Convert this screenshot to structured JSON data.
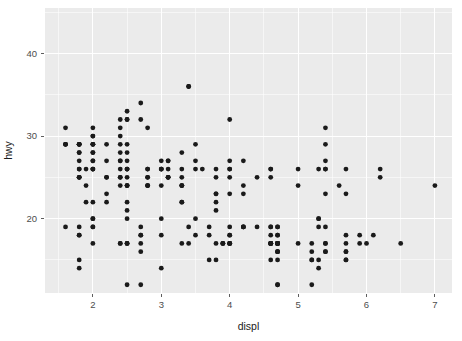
{
  "chart_data": {
    "type": "scatter",
    "title": "",
    "subtitle": "",
    "xlabel": "displ",
    "ylabel": "hwy",
    "xlim": [
      1.3,
      7.25
    ],
    "ylim": [
      11.0,
      45.5
    ],
    "xticks": [
      2,
      3,
      4,
      5,
      6,
      7
    ],
    "xtick_labels": [
      "2",
      "3",
      "4",
      "5",
      "6",
      "7"
    ],
    "yticks": [
      20,
      30,
      40
    ],
    "ytick_labels": [
      "20",
      "30",
      "40"
    ],
    "x_minor_ticks": [
      1.5,
      2.5,
      3.5,
      4.5,
      5.5,
      6.5
    ],
    "y_minor_ticks": [
      15,
      25,
      35,
      45
    ],
    "grid": true,
    "legend": null,
    "point_color": "#1a1a1a",
    "point_radius": 2.4,
    "panel_background": "#ebebeb",
    "grid_color": "#ffffff",
    "axis_text_color": "#4d4d4d",
    "n_points": 234,
    "x": [
      1.8,
      1.8,
      2.0,
      2.0,
      2.8,
      2.8,
      3.1,
      1.8,
      1.8,
      2.0,
      2.0,
      2.8,
      2.8,
      3.1,
      3.1,
      2.8,
      3.1,
      4.2,
      5.3,
      5.3,
      5.3,
      5.7,
      6.0,
      5.7,
      5.7,
      6.2,
      6.2,
      7.0,
      5.3,
      5.3,
      5.7,
      6.5,
      2.4,
      2.4,
      3.1,
      3.5,
      3.6,
      2.4,
      3.0,
      3.3,
      3.3,
      3.3,
      3.3,
      3.3,
      3.8,
      3.8,
      3.8,
      4.0,
      3.7,
      3.7,
      3.9,
      3.9,
      4.7,
      4.7,
      4.7,
      5.2,
      5.2,
      3.9,
      4.7,
      4.7,
      4.7,
      5.2,
      5.7,
      5.9,
      4.7,
      4.7,
      4.7,
      4.7,
      4.7,
      4.7,
      5.2,
      5.2,
      5.7,
      5.9,
      4.6,
      5.4,
      5.4,
      4.0,
      4.0,
      4.6,
      5.0,
      4.2,
      4.2,
      4.6,
      4.6,
      4.6,
      5.4,
      5.4,
      3.8,
      3.8,
      4.0,
      4.0,
      4.6,
      4.6,
      4.6,
      4.6,
      5.4,
      1.6,
      1.6,
      1.6,
      1.6,
      1.6,
      1.8,
      1.8,
      1.8,
      2.0,
      2.4,
      2.4,
      2.4,
      2.4,
      2.5,
      2.5,
      3.3,
      2.0,
      2.0,
      2.0,
      2.0,
      2.7,
      2.7,
      2.7,
      3.0,
      3.7,
      4.0,
      4.7,
      4.7,
      4.7,
      5.7,
      6.1,
      4.0,
      4.2,
      4.4,
      4.6,
      5.4,
      5.4,
      5.4,
      4.0,
      4.0,
      4.6,
      5.0,
      2.4,
      2.4,
      2.5,
      2.5,
      3.5,
      3.5,
      3.0,
      3.0,
      3.5,
      3.3,
      3.3,
      4.0,
      5.6,
      3.1,
      3.8,
      3.8,
      3.8,
      5.3,
      2.5,
      2.5,
      2.5,
      2.5,
      2.5,
      2.5,
      2.2,
      2.2,
      2.5,
      2.5,
      2.5,
      2.5,
      2.5,
      2.5,
      2.7,
      2.7,
      3.4,
      3.4,
      2.0,
      2.0,
      2.0,
      2.0,
      2.8,
      1.9,
      2.0,
      2.0,
      2.0,
      2.0,
      2.5,
      2.5,
      2.8,
      2.8,
      1.9,
      1.9,
      2.0,
      2.0,
      2.5,
      2.5,
      1.8,
      1.8,
      1.8,
      1.8,
      1.8,
      4.7,
      5.7,
      2.7,
      2.7,
      2.7,
      3.4,
      3.4,
      4.0,
      4.7,
      2.2,
      2.2,
      2.4,
      2.4,
      3.0,
      3.0,
      3.5,
      2.2,
      2.2,
      2.4,
      2.4,
      3.0,
      3.0,
      3.3,
      1.8,
      1.8,
      1.8,
      1.8,
      1.8,
      4.2,
      4.2,
      4.4,
      4.6,
      5.4,
      5.4,
      5.4,
      4.0,
      4.0,
      4.6,
      5.0
    ],
    "y": [
      29,
      29,
      31,
      30,
      26,
      26,
      27,
      26,
      25,
      28,
      27,
      25,
      25,
      25,
      25,
      24,
      25,
      23,
      20,
      15,
      20,
      17,
      17,
      26,
      23,
      26,
      25,
      24,
      19,
      14,
      15,
      17,
      27,
      30,
      26,
      29,
      26,
      24,
      24,
      22,
      22,
      24,
      24,
      17,
      22,
      21,
      23,
      23,
      19,
      18,
      17,
      17,
      19,
      19,
      12,
      17,
      15,
      17,
      17,
      12,
      17,
      16,
      18,
      18,
      16,
      16,
      17,
      17,
      17,
      16,
      12,
      15,
      16,
      17,
      15,
      17,
      17,
      18,
      17,
      19,
      17,
      19,
      19,
      17,
      17,
      17,
      16,
      16,
      17,
      15,
      17,
      17,
      18,
      17,
      19,
      17,
      19,
      19,
      29,
      31,
      29,
      29,
      29,
      29,
      28,
      29,
      26,
      29,
      28,
      27,
      24,
      24,
      24,
      22,
      19,
      20,
      17,
      12,
      19,
      18,
      14,
      15,
      18,
      18,
      15,
      17,
      16,
      18,
      17,
      19,
      19,
      17,
      29,
      27,
      31,
      32,
      27,
      26,
      26,
      25,
      25,
      17,
      17,
      20,
      18,
      26,
      26,
      27,
      28,
      25,
      25,
      24,
      27,
      25,
      26,
      23,
      26,
      26,
      26,
      26,
      25,
      24,
      21,
      22,
      23,
      22,
      20,
      33,
      32,
      32,
      29,
      32,
      34,
      36,
      36,
      29,
      26,
      27,
      30,
      31,
      26,
      26,
      28,
      26,
      29,
      28,
      27,
      24,
      24,
      24,
      22,
      19,
      20,
      17,
      12,
      19,
      18,
      14,
      15,
      18,
      18,
      15,
      17,
      16,
      18,
      17,
      19,
      19,
      17,
      29,
      27,
      31,
      32,
      27,
      26,
      26,
      25,
      25,
      17,
      17,
      20,
      18,
      26,
      26,
      27,
      28,
      25,
      25,
      24,
      27,
      25,
      26,
      23,
      26,
      26,
      26,
      26,
      25,
      24,
      21,
      22,
      23,
      22,
      20,
      33,
      32,
      32,
      29,
      32,
      34,
      36,
      36,
      29,
      26,
      27,
      30,
      31,
      26,
      26,
      28,
      26,
      29,
      28,
      27,
      24,
      24,
      24,
      22,
      19,
      20,
      17,
      12,
      19,
      18,
      14,
      15,
      18,
      18,
      15,
      17,
      16,
      18,
      17,
      19,
      19,
      17,
      29,
      27,
      31,
      32,
      27,
      26,
      26,
      25,
      25,
      17,
      17,
      20,
      18,
      26,
      26,
      27,
      28,
      25,
      25,
      24,
      27,
      25,
      26,
      23,
      26,
      26,
      26,
      26,
      25,
      24,
      21,
      22,
      23,
      22,
      20,
      33,
      32,
      32,
      29,
      32,
      34,
      36,
      36,
      29,
      26,
      27,
      30,
      31,
      26,
      26,
      28,
      26,
      29,
      28,
      27,
      24,
      24,
      24,
      22,
      19,
      20,
      17,
      12,
      19,
      18,
      14,
      15,
      18,
      18,
      15,
      17,
      16,
      18,
      17,
      19,
      19,
      17,
      29,
      27,
      31,
      32,
      27,
      26,
      26,
      25,
      25,
      17,
      17,
      20,
      18,
      26,
      26,
      27,
      28,
      25,
      25,
      24,
      27,
      25,
      26,
      23,
      26,
      26,
      26,
      26,
      25,
      24,
      21,
      22,
      23,
      22,
      20,
      33,
      32,
      32,
      29,
      32,
      34,
      36,
      36,
      29,
      26,
      27,
      30,
      31,
      26,
      26,
      28,
      26,
      44,
      41,
      33,
      35,
      35,
      36,
      37,
      41,
      44,
      33,
      30,
      30,
      30,
      29,
      29,
      29,
      28,
      29,
      26,
      29,
      28,
      27,
      24,
      24,
      24,
      22,
      19,
      20,
      17,
      12,
      19,
      18,
      14,
      15,
      18,
      18,
      15,
      17,
      16,
      18,
      17,
      19,
      19,
      17,
      29,
      27,
      31,
      32,
      27,
      26,
      26,
      25,
      25,
      17,
      17,
      20,
      18,
      26,
      26,
      27,
      28,
      25,
      25,
      24,
      27,
      25,
      26,
      23,
      26,
      26,
      26,
      26,
      25,
      24,
      21,
      22,
      23,
      22,
      20,
      33,
      32,
      32,
      29,
      32,
      34,
      36,
      36,
      29,
      26,
      27,
      30,
      31,
      26,
      26,
      28,
      26,
      23,
      24,
      24,
      22,
      19,
      20,
      17,
      12,
      19,
      18,
      14,
      15,
      18,
      18,
      15,
      17,
      16,
      18,
      17,
      19,
      19,
      17
    ]
  },
  "plot_geometry": {
    "panel_left": 45,
    "panel_right": 452,
    "panel_top": 8,
    "panel_bottom": 293,
    "x_axis_label_y": 330,
    "y_axis_label_x": 12
  }
}
